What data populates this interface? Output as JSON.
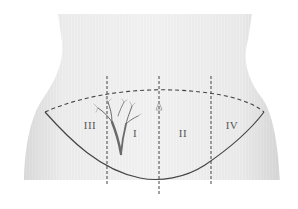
{
  "diagram": {
    "regions": [
      {
        "id": "III",
        "label": "III",
        "x": 90,
        "y": 125
      },
      {
        "id": "I",
        "label": "I",
        "x": 135,
        "y": 133
      },
      {
        "id": "II",
        "label": "II",
        "x": 183,
        "y": 133
      },
      {
        "id": "IV",
        "label": "IV",
        "x": 232,
        "y": 125
      }
    ],
    "colors": {
      "skin": "#efefef",
      "skin_shadow": "#d6d6d6",
      "dash_line": "#444444",
      "tree": "#6a6a6a",
      "background": "#ffffff"
    }
  }
}
